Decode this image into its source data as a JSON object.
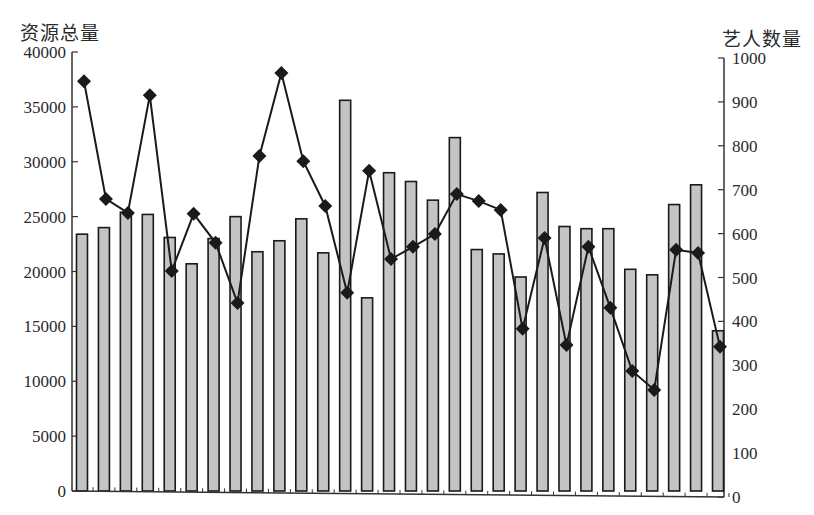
{
  "chart_data": {
    "type": "bar+line",
    "title": "",
    "left_axis": {
      "label": "资源总量",
      "min": 0,
      "max": 40000,
      "ticks": [
        0,
        5000,
        10000,
        15000,
        20000,
        25000,
        30000,
        35000,
        40000
      ]
    },
    "right_axis": {
      "label": "艺人数量",
      "min": 0,
      "max": 1000,
      "ticks": [
        0,
        100,
        200,
        300,
        400,
        500,
        600,
        700,
        800,
        900,
        1000
      ]
    },
    "categories": [
      1,
      2,
      3,
      4,
      5,
      6,
      7,
      8,
      9,
      10,
      11,
      12,
      13,
      14,
      15,
      16,
      17,
      18,
      19,
      20,
      21,
      22,
      23,
      24,
      25,
      26,
      27,
      28,
      29,
      30
    ],
    "series": [
      {
        "name": "资源总量",
        "type": "bar",
        "axis": "left",
        "values": [
          23400,
          24000,
          25400,
          25200,
          23100,
          20700,
          23000,
          25000,
          21800,
          22800,
          24800,
          21700,
          35600,
          17600,
          29000,
          28200,
          26500,
          32200,
          22000,
          21600,
          19500,
          27200,
          24100,
          23900,
          23900,
          20200,
          19700,
          26100,
          27900,
          14600
        ]
      },
      {
        "name": "艺人数量",
        "type": "line",
        "axis": "right",
        "marker": "diamond",
        "values": [
          947,
          679,
          647,
          915,
          515,
          645,
          579,
          442,
          777,
          966,
          765,
          663,
          465,
          743,
          542,
          570,
          599,
          690,
          674,
          654,
          383,
          590,
          346,
          570,
          431,
          287,
          244,
          563,
          556,
          342
        ]
      }
    ],
    "grid": false,
    "legend": null,
    "colors": {
      "bar_fill": "#c4c4c4",
      "bar_stroke": "#1a1a1a",
      "line": "#1a1a1a",
      "axis": "#333333"
    }
  }
}
